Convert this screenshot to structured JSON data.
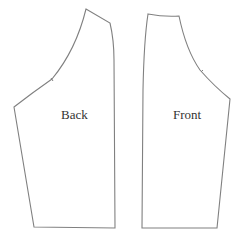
{
  "diagram": {
    "type": "sewing-pattern",
    "pieces": [
      {
        "id": "back",
        "label": "Back"
      },
      {
        "id": "front",
        "label": "Front"
      }
    ],
    "stroke_color": "#808080",
    "text_color": "#333333",
    "background": "#ffffff"
  }
}
